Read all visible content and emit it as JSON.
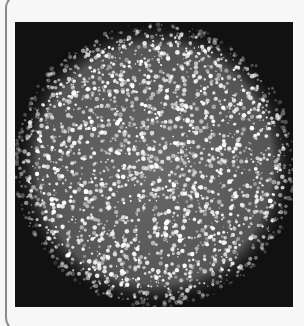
{
  "figure": {
    "background_color": "#111111",
    "speckle_color": "#ffffff",
    "panel": {
      "x": 15,
      "y": 22,
      "width": 278,
      "height": 285
    },
    "disk": {
      "cx": 140,
      "cy": 143,
      "rx": 138,
      "ry": 140
    },
    "speckles": {
      "count": 2600,
      "seed": 7,
      "min_r": 0.6,
      "max_r": 2.4
    }
  }
}
